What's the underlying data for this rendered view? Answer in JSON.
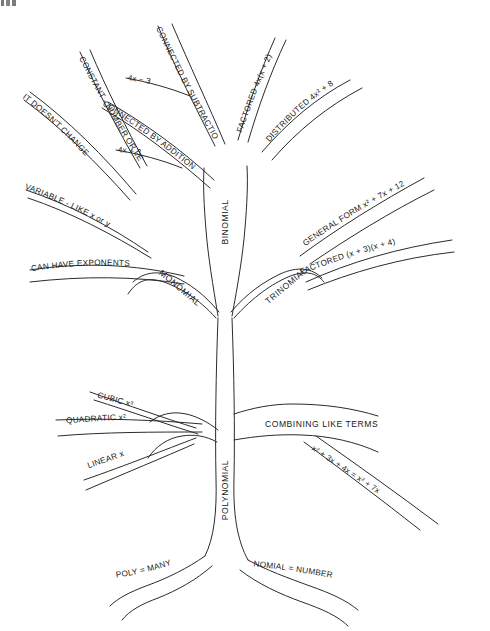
{
  "document": {
    "title": "Polynomial Tree Diagram",
    "type": "concept-map-tree",
    "background_color": "#ffffff",
    "ink_color": "#2b2b2b"
  },
  "trunk": {
    "label": "POLYNOMIAL"
  },
  "roots": [
    {
      "id": "poly-many",
      "label": "POLY = MANY"
    },
    {
      "id": "nomial-number",
      "label": "NOMIAL = NUMBER"
    }
  ],
  "main_branches": [
    {
      "id": "monomial",
      "label": "MONOMIAL"
    },
    {
      "id": "binomial",
      "label": "BINOMIAL"
    },
    {
      "id": "trinomial",
      "label": "TRINOMIAL"
    }
  ],
  "monomial_branches": [
    {
      "id": "constant",
      "label": "CONSTANT - NUMBER OR LETTER"
    },
    {
      "id": "doesnt-change",
      "label": "IT DOESN'T CHANGE"
    },
    {
      "id": "variable",
      "label": "VARIABLE - LIKE x or y"
    },
    {
      "id": "exponents",
      "label": "CAN HAVE EXPONENTS"
    }
  ],
  "binomial_branches": [
    {
      "id": "conn-subtraction",
      "label": "CONNECTED BY SUBTRACTION",
      "example": "4x − 3"
    },
    {
      "id": "conn-addition",
      "label": "CONNECTED BY ADDITION",
      "example": "4x + 3"
    },
    {
      "id": "factored",
      "label": "FACTORED  4x(x + 2)"
    },
    {
      "id": "distributed",
      "label": "DISTRIBUTED  4x² + 8"
    }
  ],
  "trinomial_branches": [
    {
      "id": "general-form",
      "label": "GENERAL FORM  x² + 7x + 12"
    },
    {
      "id": "factored-tri",
      "label": "FACTORED (x + 3)(x + 4)"
    }
  ],
  "degree_branches": [
    {
      "id": "cubic",
      "label": "CUBIC x³"
    },
    {
      "id": "quadratic",
      "label": "QUADRATIC x²"
    },
    {
      "id": "linear",
      "label": "LINEAR x"
    }
  ],
  "operations_branch": {
    "label": "COMBINING LIKE TERMS",
    "example": "x² + 3x + 4x = x² + 7x"
  }
}
